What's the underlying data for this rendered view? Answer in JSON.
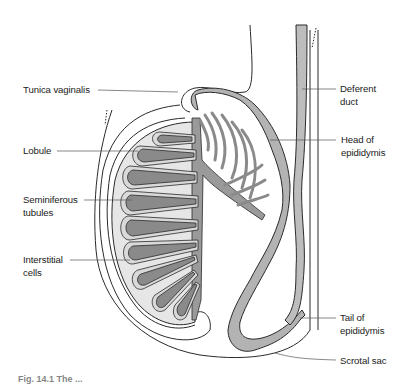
{
  "figure": {
    "colors": {
      "background": "#ffffff",
      "outline": "#2a2a2a",
      "leader_line": "#555555",
      "tubule_fill": "#8a8a8a",
      "lobule_fill": "#d9d9d9",
      "testis_fill": "#e6e6e6",
      "epididymis_fill": "#b3b3b3",
      "duct_fill": "#bdbdbd"
    },
    "labels": {
      "tunica_vaginalis": [
        "Tunica vaginalis"
      ],
      "lobule": [
        "Lobule"
      ],
      "seminiferous_tubules": [
        "Seminiferous",
        "tubules"
      ],
      "interstitial_cells": [
        "Interstitial",
        "cells"
      ],
      "deferent_duct": [
        "Deferent",
        "duct"
      ],
      "head_of_epididymis": [
        "Head of",
        "epididymis"
      ],
      "tail_of_epididymis": [
        "Tail of",
        "epididymis"
      ],
      "scrotal_sac": [
        "Scrotal sac"
      ]
    },
    "caption": "Fig. 14.1  The ..."
  }
}
